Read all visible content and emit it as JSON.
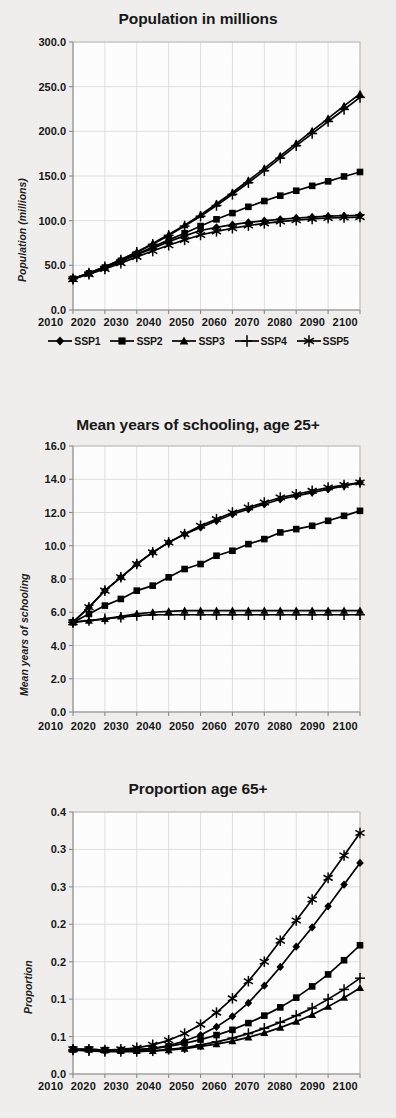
{
  "figure": {
    "background_color": "#f1f0ee",
    "series_color": "#000000",
    "grid_color": "#d8d8d8"
  },
  "legend": {
    "position": "below-first-panel",
    "items": [
      {
        "label": "SSP1",
        "marker": "diamond"
      },
      {
        "label": "SSP2",
        "marker": "square"
      },
      {
        "label": "SSP3",
        "marker": "triangle"
      },
      {
        "label": "SSP4",
        "marker": "plus"
      },
      {
        "label": "SSP5",
        "marker": "asterisk"
      }
    ]
  },
  "chart_data": [
    {
      "type": "line",
      "title": "Population in millions",
      "xlabel": "",
      "ylabel": "Population (millions)",
      "x": [
        2010,
        2015,
        2020,
        2025,
        2030,
        2035,
        2040,
        2045,
        2050,
        2055,
        2060,
        2065,
        2070,
        2075,
        2080,
        2085,
        2090,
        2095,
        2100
      ],
      "xlim": [
        2010,
        2100
      ],
      "ylim": [
        0.0,
        300.0
      ],
      "xticks": [
        2010,
        2020,
        2030,
        2040,
        2050,
        2060,
        2070,
        2080,
        2090,
        2100
      ],
      "xticklabels": [
        "2010",
        "2020",
        "2030",
        "2040",
        "2050",
        "2060",
        "2070",
        "2080",
        "2090",
        "2100"
      ],
      "yticks": [
        0.0,
        50.0,
        100.0,
        150.0,
        200.0,
        250.0,
        300.0
      ],
      "yticklabels": [
        "0.0",
        "50.0",
        "100.0",
        "150.0",
        "200.0",
        "250.0",
        "300.0"
      ],
      "grid": true,
      "series": [
        {
          "name": "SSP1",
          "marker": "diamond",
          "values": [
            35.0,
            41.0,
            47.5,
            54.5,
            62.0,
            69.0,
            76.5,
            83.0,
            89.0,
            92.5,
            95.5,
            98.0,
            100.0,
            101.5,
            103.0,
            104.0,
            105.0,
            105.5,
            106.0
          ]
        },
        {
          "name": "SSP2",
          "marker": "square",
          "values": [
            35.0,
            41.0,
            47.5,
            55.0,
            62.5,
            70.5,
            78.5,
            86.0,
            94.0,
            101.5,
            108.5,
            115.5,
            122.0,
            128.0,
            133.5,
            139.0,
            144.0,
            149.5,
            154.5
          ]
        },
        {
          "name": "SSP3",
          "marker": "triangle",
          "values": [
            35.0,
            41.5,
            48.5,
            56.5,
            65.0,
            74.5,
            84.5,
            95.0,
            106.5,
            119.0,
            131.5,
            145.0,
            158.5,
            172.5,
            186.5,
            200.5,
            214.5,
            228.5,
            242.0
          ]
        },
        {
          "name": "SSP4",
          "marker": "plus",
          "values": [
            35.0,
            41.5,
            48.5,
            56.0,
            64.5,
            73.5,
            83.5,
            94.0,
            105.0,
            117.0,
            129.5,
            142.5,
            156.0,
            170.0,
            184.0,
            197.5,
            211.0,
            224.5,
            238.0
          ]
        },
        {
          "name": "SSP5",
          "marker": "asterisk",
          "values": [
            34.5,
            40.0,
            46.0,
            52.5,
            59.5,
            66.0,
            72.5,
            78.5,
            84.0,
            88.0,
            91.5,
            94.5,
            97.0,
            99.0,
            100.5,
            102.0,
            103.0,
            103.5,
            104.0
          ]
        }
      ]
    },
    {
      "type": "line",
      "title": "Mean years of schooling, age 25+",
      "xlabel": "",
      "ylabel": "Mean years of schooling",
      "x": [
        2010,
        2015,
        2020,
        2025,
        2030,
        2035,
        2040,
        2045,
        2050,
        2055,
        2060,
        2065,
        2070,
        2075,
        2080,
        2085,
        2090,
        2095,
        2100
      ],
      "xlim": [
        2010,
        2100
      ],
      "ylim": [
        0.0,
        16.0
      ],
      "xticks": [
        2010,
        2020,
        2030,
        2040,
        2050,
        2060,
        2070,
        2080,
        2090,
        2100
      ],
      "xticklabels": [
        "2010",
        "2020",
        "2030",
        "2040",
        "2050",
        "2060",
        "2070",
        "2080",
        "2090",
        "2100"
      ],
      "yticks": [
        0.0,
        2.0,
        4.0,
        6.0,
        8.0,
        10.0,
        12.0,
        14.0,
        16.0
      ],
      "yticklabels": [
        "0.0",
        "2.0",
        "4.0",
        "6.0",
        "8.0",
        "10.0",
        "12.0",
        "14.0",
        "16.0"
      ],
      "grid": true,
      "series": [
        {
          "name": "SSP1",
          "marker": "diamond",
          "values": [
            5.4,
            6.3,
            7.3,
            8.1,
            8.9,
            9.6,
            10.2,
            10.7,
            11.1,
            11.5,
            11.9,
            12.2,
            12.5,
            12.8,
            13.0,
            13.2,
            13.4,
            13.6,
            13.8
          ]
        },
        {
          "name": "SSP2",
          "marker": "square",
          "values": [
            5.4,
            5.9,
            6.4,
            6.8,
            7.3,
            7.6,
            8.1,
            8.6,
            8.9,
            9.4,
            9.7,
            10.1,
            10.4,
            10.8,
            11.0,
            11.2,
            11.5,
            11.8,
            12.1
          ]
        },
        {
          "name": "SSP3",
          "marker": "triangle",
          "values": [
            5.4,
            5.5,
            5.6,
            5.75,
            5.9,
            6.0,
            6.05,
            6.1,
            6.1,
            6.1,
            6.1,
            6.1,
            6.1,
            6.1,
            6.1,
            6.1,
            6.1,
            6.1,
            6.1
          ]
        },
        {
          "name": "SSP4",
          "marker": "plus",
          "values": [
            5.4,
            5.5,
            5.6,
            5.7,
            5.8,
            5.85,
            5.85,
            5.85,
            5.85,
            5.85,
            5.85,
            5.85,
            5.85,
            5.85,
            5.85,
            5.85,
            5.85,
            5.85,
            5.85
          ]
        },
        {
          "name": "SSP5",
          "marker": "asterisk",
          "values": [
            5.4,
            6.3,
            7.3,
            8.1,
            8.9,
            9.6,
            10.2,
            10.7,
            11.2,
            11.6,
            12.0,
            12.3,
            12.6,
            12.9,
            13.1,
            13.3,
            13.5,
            13.65,
            13.8
          ]
        }
      ]
    },
    {
      "type": "line",
      "title": "Proportion age 65+",
      "xlabel": "",
      "ylabel": "Proportion",
      "x": [
        2010,
        2015,
        2020,
        2025,
        2030,
        2035,
        2040,
        2045,
        2050,
        2055,
        2060,
        2065,
        2070,
        2075,
        2080,
        2085,
        2090,
        2095,
        2100
      ],
      "xlim": [
        2010,
        2100
      ],
      "ylim": [
        0.0,
        0.35
      ],
      "xticks": [
        2010,
        2020,
        2030,
        2040,
        2050,
        2060,
        2070,
        2080,
        2090,
        2100
      ],
      "xticklabels": [
        "2010",
        "2020",
        "2030",
        "2040",
        "2050",
        "2060",
        "2070",
        "2080",
        "2090",
        "2100"
      ],
      "yticks": [
        0.0,
        0.05,
        0.1,
        0.15,
        0.2,
        0.25,
        0.3,
        0.35
      ],
      "yticklabels": [
        "0.0",
        "0.1",
        "0.1",
        "0.2",
        "0.2",
        "0.3",
        "0.3",
        "0.4"
      ],
      "grid": true,
      "series": [
        {
          "name": "SSP1",
          "marker": "diamond",
          "values": [
            0.032,
            0.032,
            0.031,
            0.031,
            0.032,
            0.034,
            0.038,
            0.044,
            0.052,
            0.063,
            0.077,
            0.095,
            0.118,
            0.143,
            0.17,
            0.196,
            0.224,
            0.253,
            0.282
          ]
        },
        {
          "name": "SSP2",
          "marker": "square",
          "values": [
            0.033,
            0.033,
            0.032,
            0.032,
            0.033,
            0.034,
            0.037,
            0.041,
            0.046,
            0.052,
            0.059,
            0.068,
            0.078,
            0.089,
            0.102,
            0.117,
            0.133,
            0.152,
            0.172
          ]
        },
        {
          "name": "SSP3",
          "marker": "triangle",
          "values": [
            0.033,
            0.033,
            0.032,
            0.031,
            0.031,
            0.031,
            0.032,
            0.034,
            0.037,
            0.04,
            0.044,
            0.049,
            0.055,
            0.062,
            0.07,
            0.079,
            0.09,
            0.102,
            0.115
          ]
        },
        {
          "name": "SSP4",
          "marker": "plus",
          "values": [
            0.032,
            0.031,
            0.03,
            0.03,
            0.03,
            0.031,
            0.033,
            0.035,
            0.039,
            0.043,
            0.048,
            0.054,
            0.061,
            0.069,
            0.078,
            0.088,
            0.1,
            0.113,
            0.128
          ]
        },
        {
          "name": "SSP5",
          "marker": "asterisk",
          "values": [
            0.033,
            0.033,
            0.032,
            0.033,
            0.035,
            0.039,
            0.045,
            0.054,
            0.066,
            0.082,
            0.101,
            0.124,
            0.15,
            0.178,
            0.205,
            0.233,
            0.262,
            0.292,
            0.322
          ]
        }
      ]
    }
  ]
}
